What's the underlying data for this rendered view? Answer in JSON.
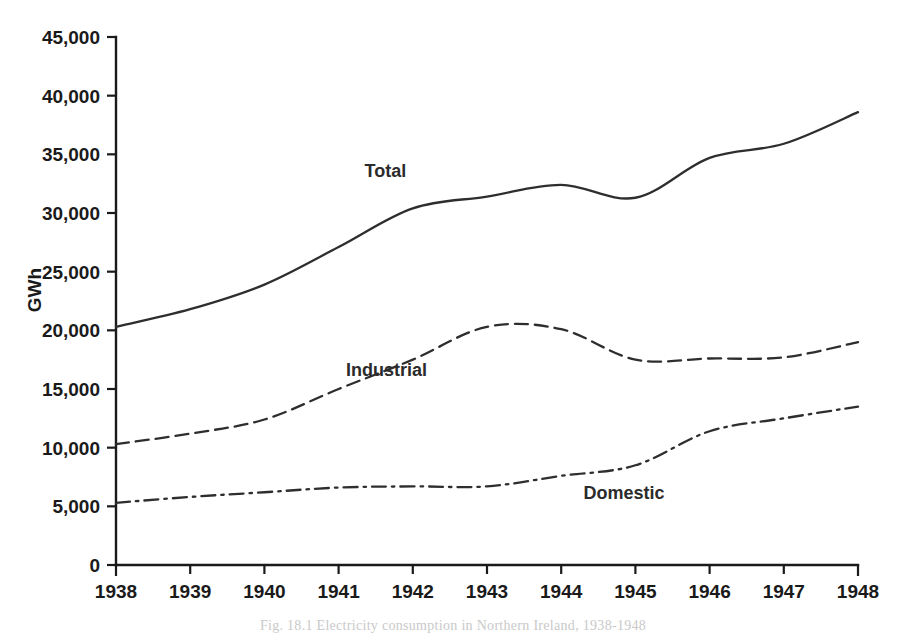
{
  "chart_data": {
    "type": "line",
    "title": "",
    "xlabel": "",
    "ylabel": "GWh",
    "x": [
      1938,
      1939,
      1940,
      1941,
      1942,
      1943,
      1944,
      1945,
      1946,
      1947,
      1948
    ],
    "xtick_labels": [
      "1938",
      "1939",
      "1940",
      "1941",
      "1942",
      "1943",
      "1944",
      "1945",
      "1946",
      "1947",
      "1948"
    ],
    "ytick_labels": [
      "0",
      "5,000",
      "10,000",
      "15,000",
      "20,000",
      "25,000",
      "30,000",
      "35,000",
      "40,000",
      "45,000"
    ],
    "ytick_values": [
      0,
      5000,
      10000,
      15000,
      20000,
      25000,
      30000,
      35000,
      40000,
      45000
    ],
    "ylim": [
      0,
      45000
    ],
    "xlim": [
      1938,
      1948
    ],
    "grid": false,
    "legend_position": "inline-annotations",
    "series": [
      {
        "name": "Total",
        "style": "solid",
        "color": "#2e2e2e",
        "values": [
          20300,
          21800,
          23900,
          27100,
          30400,
          31400,
          32400,
          31300,
          34700,
          35900,
          38600
        ]
      },
      {
        "name": "Industrial",
        "style": "dashed",
        "color": "#2e2e2e",
        "values": [
          10300,
          11200,
          12400,
          15000,
          17500,
          20300,
          20100,
          17500,
          17600,
          17700,
          19000
        ]
      },
      {
        "name": "Domestic",
        "style": "dash-dot",
        "color": "#2e2e2e",
        "values": [
          5300,
          5800,
          6200,
          6600,
          6700,
          6700,
          7600,
          8500,
          11400,
          12500,
          13500
        ]
      }
    ],
    "annotations": [
      {
        "text": "Total",
        "x": 1941.35,
        "y": 33100
      },
      {
        "text": "Industrial",
        "x": 1941.1,
        "y": 16100
      },
      {
        "text": "Domestic",
        "x": 1944.3,
        "y": 5600
      }
    ]
  },
  "caption": {
    "text": "Fig. 18.1  Electricity consumption in Northern Ireland, 1938-1948"
  }
}
